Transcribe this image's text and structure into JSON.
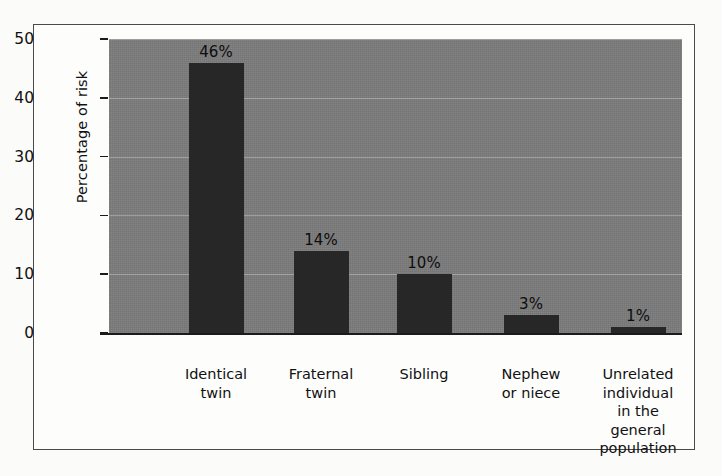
{
  "figure": {
    "frame_color": "#4a4a4a",
    "plot_background": "#7b7b7b",
    "bar_color": "#272727",
    "paper_color": "#fbfbfa"
  },
  "chart_data": {
    "type": "bar",
    "title": "",
    "xlabel": "",
    "ylabel": "Percentage of risk",
    "ylim": [
      0,
      50
    ],
    "yticks": [
      0,
      10,
      20,
      30,
      40,
      50
    ],
    "ytick_labels": [
      "0",
      "10",
      "20",
      "30",
      "40",
      "50"
    ],
    "grid": true,
    "grid_axis": "y",
    "legend": false,
    "categories": [
      "Identical twin",
      "Fraternal twin",
      "Sibling",
      "Nephew or niece",
      "Unrelated individual in the general population"
    ],
    "category_lines": [
      [
        "Identical",
        "twin"
      ],
      [
        "Fraternal",
        "twin"
      ],
      [
        "Sibling"
      ],
      [
        "Nephew",
        "or niece"
      ],
      [
        "Unrelated",
        "individual",
        "in the",
        "general",
        "population"
      ]
    ],
    "values": [
      46,
      14,
      10,
      3,
      1
    ],
    "value_labels": [
      "46%",
      "14%",
      "10%",
      "3%",
      "1%"
    ]
  }
}
